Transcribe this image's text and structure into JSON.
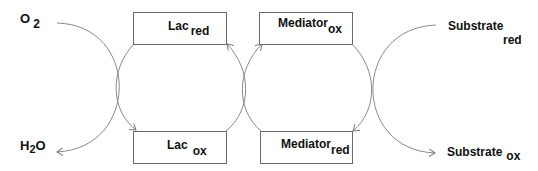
{
  "diagram": {
    "type": "coupled-redox-cycles",
    "line_color": "#7a7a7a",
    "left": {
      "top": {
        "main": "O",
        "sub": "2"
      },
      "bottom": {
        "pre": "H",
        "sub": "2",
        "post": "O"
      }
    },
    "boxes": {
      "lac_red": {
        "main": "Lac",
        "sub": "red"
      },
      "lac_ox": {
        "main": "Lac",
        "sub": "ox"
      },
      "mediator_ox": {
        "main": "Mediator",
        "sub": "ox"
      },
      "mediator_red": {
        "main": "Mediator",
        "sub": "red"
      }
    },
    "right": {
      "top": {
        "main": "Substrate",
        "sub": "red"
      },
      "bottom": {
        "main": "Substrate",
        "sub": "ox"
      }
    }
  }
}
